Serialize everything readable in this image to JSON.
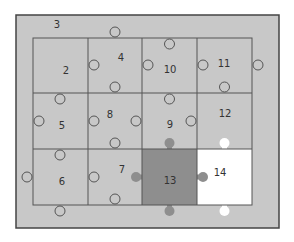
{
  "figure": {
    "frame": {
      "x": 16,
      "y": 15,
      "w": 263,
      "h": 213,
      "fill": "#c8c8c8",
      "stroke": "#444444"
    },
    "grid": {
      "x0": 33,
      "y0": 38,
      "cols": [
        33,
        88,
        142,
        197,
        252
      ],
      "rows": [
        38,
        93,
        149,
        205
      ]
    },
    "colors": {
      "piece": "#c8c8c8",
      "selected": "#8e8e8e",
      "empty": "#ffffff",
      "line": "#555555"
    },
    "frame_label": {
      "text": "3",
      "x": 57,
      "y": 28
    },
    "pieces": [
      {
        "id": "2",
        "label": "2",
        "x": 66,
        "y": 74,
        "state": "normal"
      },
      {
        "id": "4",
        "label": "4",
        "x": 121,
        "y": 61,
        "state": "normal"
      },
      {
        "id": "10",
        "label": "10",
        "x": 170,
        "y": 73,
        "state": "normal"
      },
      {
        "id": "11",
        "label": "11",
        "x": 224,
        "y": 67,
        "state": "normal"
      },
      {
        "id": "5",
        "label": "5",
        "x": 62,
        "y": 129,
        "state": "normal"
      },
      {
        "id": "8",
        "label": "8",
        "x": 110,
        "y": 118,
        "state": "normal"
      },
      {
        "id": "9",
        "label": "9",
        "x": 170,
        "y": 128,
        "state": "normal"
      },
      {
        "id": "12",
        "label": "12",
        "x": 225,
        "y": 117,
        "state": "normal"
      },
      {
        "id": "6",
        "label": "6",
        "x": 62,
        "y": 185,
        "state": "normal"
      },
      {
        "id": "7",
        "label": "7",
        "x": 122,
        "y": 173,
        "state": "normal"
      },
      {
        "id": "13",
        "label": "13",
        "x": 170,
        "y": 184,
        "state": "selected"
      },
      {
        "id": "14",
        "label": "14",
        "x": 220,
        "y": 176,
        "state": "empty"
      }
    ]
  }
}
